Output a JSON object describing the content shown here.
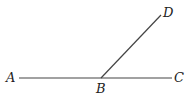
{
  "diagram": {
    "type": "geometry-angle",
    "points": {
      "A": {
        "label": "A",
        "x": 19,
        "y": 78
      },
      "B": {
        "label": "B",
        "x": 101,
        "y": 78
      },
      "C": {
        "label": "C",
        "x": 172,
        "y": 78
      },
      "D": {
        "label": "D",
        "x": 161,
        "y": 15
      }
    },
    "segments": [
      {
        "name": "AC",
        "from": "A",
        "to": "C"
      },
      {
        "name": "BD",
        "from": "B",
        "to": "D"
      }
    ],
    "colors": {
      "line": "#444444",
      "text": "#222222",
      "background": "#ffffff"
    }
  }
}
